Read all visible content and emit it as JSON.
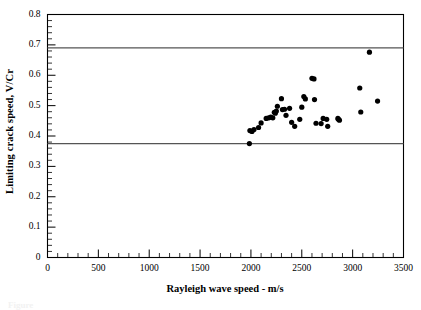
{
  "chart_data": {
    "type": "scatter",
    "title": "",
    "xlabel": "Rayleigh wave speed - m/s",
    "ylabel": "Limiting crack speed, V/Cr",
    "xlim": [
      0,
      3500
    ],
    "ylim": [
      0,
      0.8
    ],
    "xticks": [
      0,
      500,
      1000,
      1500,
      2000,
      2500,
      3000,
      3500
    ],
    "xtick_labels": [
      "0",
      "500",
      "1000",
      "1500",
      "2000",
      "2500",
      "3000",
      "3500"
    ],
    "yticks": [
      0,
      0.1,
      0.2,
      0.3,
      0.4,
      0.5,
      0.6,
      0.7,
      0.8
    ],
    "ytick_labels": [
      "0",
      "0.1",
      "0.2",
      "0.3",
      "0.4",
      "0.5",
      "0.6",
      "0.7",
      "0.8"
    ],
    "minor_ticks": true,
    "grid": false,
    "legend": null,
    "marker": "filled-circle",
    "marker_color": "#000000",
    "marker_size": 2.6,
    "frame_color": "#000000",
    "reference_lines": [
      {
        "name": "upper-limit-line",
        "y": 0.69,
        "color": "#555555",
        "width": 1.2
      },
      {
        "name": "lower-limit-line",
        "y": 0.375,
        "color": "#555555",
        "width": 1.2
      }
    ],
    "x": [
      1985,
      1990,
      2010,
      2030,
      2075,
      2100,
      2150,
      2175,
      2195,
      2215,
      2230,
      2240,
      2250,
      2260,
      2300,
      2310,
      2330,
      2345,
      2380,
      2400,
      2430,
      2480,
      2500,
      2520,
      2535,
      2600,
      2620,
      2625,
      2640,
      2690,
      2710,
      2745,
      2755,
      2855,
      2860,
      2870,
      3070,
      3080,
      3165,
      3245
    ],
    "y": [
      0.375,
      0.418,
      0.415,
      0.421,
      0.428,
      0.443,
      0.458,
      0.46,
      0.462,
      0.46,
      0.478,
      0.475,
      0.482,
      0.498,
      0.523,
      0.487,
      0.488,
      0.468,
      0.491,
      0.445,
      0.432,
      0.455,
      0.495,
      0.53,
      0.522,
      0.59,
      0.588,
      0.52,
      0.442,
      0.441,
      0.458,
      0.455,
      0.432,
      0.458,
      0.455,
      0.452,
      0.558,
      0.479,
      0.676,
      0.515
    ]
  },
  "caption": {
    "text": "Figure"
  }
}
